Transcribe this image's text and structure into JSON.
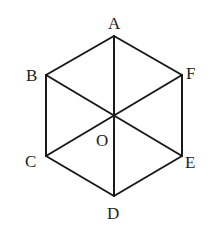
{
  "diagram": {
    "points": {
      "A": {
        "x": 114,
        "y": 36
      },
      "B": {
        "x": 46,
        "y": 75
      },
      "F": {
        "x": 182,
        "y": 75
      },
      "O": {
        "x": 114,
        "y": 116
      },
      "C": {
        "x": 46,
        "y": 156
      },
      "E": {
        "x": 182,
        "y": 156
      },
      "D": {
        "x": 114,
        "y": 196
      }
    },
    "labels": [
      {
        "text": "A",
        "x": 108,
        "y": 29
      },
      {
        "text": "B",
        "x": 26,
        "y": 81
      },
      {
        "text": "F",
        "x": 186,
        "y": 79
      },
      {
        "text": "O",
        "x": 96,
        "y": 146
      },
      {
        "text": "C",
        "x": 25,
        "y": 167
      },
      {
        "text": "E",
        "x": 185,
        "y": 168
      },
      {
        "text": "D",
        "x": 107,
        "y": 219
      }
    ],
    "hexagon_edges": [
      [
        "A",
        "B"
      ],
      [
        "B",
        "C"
      ],
      [
        "C",
        "D"
      ],
      [
        "D",
        "E"
      ],
      [
        "E",
        "F"
      ],
      [
        "F",
        "A"
      ]
    ],
    "diagonals": [
      [
        "A",
        "D"
      ],
      [
        "B",
        "E"
      ],
      [
        "C",
        "F"
      ]
    ],
    "stroke_color": "#1a1a1a",
    "label_color": "#222222"
  }
}
